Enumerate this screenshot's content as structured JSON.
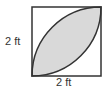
{
  "figure": {
    "type": "square-with-inscribed-lens",
    "side_label_left": "2 ft",
    "side_label_bottom": "2 ft",
    "colors": {
      "stroke": "#333333",
      "fill": "#d9d9d9",
      "background": "#ffffff"
    },
    "square": {
      "x": 32,
      "y": 7,
      "size": 69
    }
  }
}
